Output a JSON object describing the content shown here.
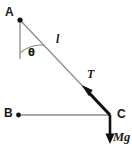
{
  "figure": {
    "background_color": "#ffffff",
    "thin_line_color": "#8c8c8c",
    "thick_line_color": "#111111",
    "text_color": "#1a1a1a",
    "points": {
      "A": {
        "label": "A",
        "x": 20,
        "y": 20
      },
      "B": {
        "label": "B",
        "x": 18,
        "y": 115
      },
      "C": {
        "label": "C",
        "x": 110,
        "y": 115
      }
    },
    "labels": {
      "length": "l",
      "tension": "T",
      "weight": "Mg",
      "angle": "θ"
    },
    "vectors": [
      {
        "name": "tension",
        "label": "T",
        "from": "C",
        "direction": "toward-A",
        "style": "thick-black-arrow"
      },
      {
        "name": "weight",
        "label": "Mg",
        "from": "C",
        "direction": "downward",
        "style": "thick-black-arrow"
      }
    ],
    "segments": [
      {
        "name": "string",
        "from": "A",
        "to": "C",
        "label": "l",
        "style": "thin-gray"
      },
      {
        "name": "vertical-reference",
        "from": "A",
        "to": "below-A",
        "style": "thin-gray"
      },
      {
        "name": "horizontal-reference",
        "from": "B",
        "to": "C",
        "style": "thin-gray"
      }
    ],
    "angle_arc": {
      "label": "θ",
      "between": [
        "vertical-reference",
        "string"
      ],
      "vertex": "A"
    }
  }
}
